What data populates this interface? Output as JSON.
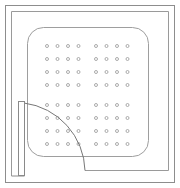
{
  "drawing": {
    "type": "architectural-line-drawing",
    "title": "Perforated panel floor plan with door swing",
    "canvas": {
      "width": 180,
      "height": 188,
      "background": "#ffffff"
    },
    "colors": {
      "outer_wall": "#8d8d8d",
      "inner_wall": "#9a9a9a",
      "panel_outline": "#9e9e9e",
      "door_leaf": "#8a8a8a",
      "swing_arc": "#777777",
      "perforation": "#9c9c9c"
    },
    "outer_frame": {
      "label": "outer wall boundary",
      "x": 5,
      "y": 5,
      "width": 170,
      "height": 178
    },
    "inner_frame": {
      "label": "inner wall line",
      "x": 11,
      "y": 11,
      "width": 158,
      "height": 160
    },
    "panel": {
      "label": "perforated panel",
      "x": 27,
      "y": 27,
      "width": 122,
      "height": 130,
      "corner_radius": 16
    },
    "perforation_grid": {
      "label": "perforation hole grid",
      "rows": 8,
      "columns": 8,
      "column_groups": 2,
      "row_groups": 2,
      "hole_diameter": 3,
      "origin_x": 47,
      "origin_y": 46,
      "spacing_x": 10.5,
      "spacing_y": 13,
      "group_gap_x": 7,
      "group_gap_y": 7,
      "total_holes": 64
    },
    "door": {
      "label": "hinged door",
      "leaf": {
        "x": 18,
        "y": 101,
        "width": 6,
        "height": 74
      },
      "hinge": {
        "x": 24,
        "y": 103
      },
      "swing_arc": {
        "start_x": 24,
        "start_y": 103,
        "end_x": 85,
        "end_y": 170,
        "radius": 68,
        "sweep_degrees": 90
      },
      "threshold": {
        "x1": 85,
        "y1": 170,
        "x2": 169,
        "y2": 170
      }
    }
  }
}
